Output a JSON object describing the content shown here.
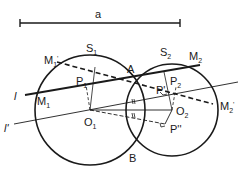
{
  "diagram": {
    "segment_label": "a",
    "circles": [
      {
        "name": "S",
        "sub": "1"
      },
      {
        "name": "S",
        "sub": "2"
      }
    ],
    "points": {
      "A": "A",
      "B": "B",
      "O1": {
        "name": "O",
        "sub": "1"
      },
      "O2": {
        "name": "O",
        "sub": "2"
      },
      "M1": {
        "name": "M",
        "sub": "1"
      },
      "M2": {
        "name": "M",
        "sub": "2"
      },
      "M1p": {
        "name": "M",
        "sub": "1",
        "prime": "'"
      },
      "M2p": {
        "name": "M",
        "sub": "2",
        "prime": "'"
      },
      "P1": {
        "name": "P",
        "sub": "1"
      },
      "P2": {
        "name": "P",
        "sub": "2"
      },
      "Pp": "P'",
      "Ppp": "P''"
    },
    "lines": {
      "l": "l",
      "lp": "l'"
    },
    "colors": {
      "stroke": "#1a1a1a",
      "background": "#ffffff"
    }
  }
}
